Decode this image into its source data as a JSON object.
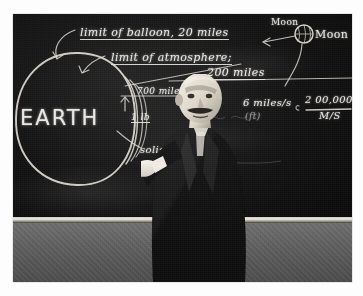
{
  "photograph": {
    "medium": "black-and-white photographic print",
    "scene": "man lecturing at a chalkboard"
  },
  "blackboard": {
    "annotations": [
      {
        "id": "balloon-limit",
        "text": "limit of balloon, 20 miles"
      },
      {
        "id": "atmosphere-limit",
        "text": "limit of atmosphere;"
      },
      {
        "id": "atmosphere-value",
        "text": "200 miles"
      },
      {
        "id": "moon-label",
        "text": "Moon"
      },
      {
        "id": "moon-caption",
        "text": "Moon"
      },
      {
        "id": "earth-label",
        "text": "EARTH"
      },
      {
        "id": "distance-700",
        "text": "700 miles"
      },
      {
        "id": "weight-1lb",
        "text": "1 lb"
      },
      {
        "id": "velocity",
        "text": "6 miles/s"
      },
      {
        "id": "velocity-unit",
        "text": "(ft)"
      },
      {
        "id": "fraction-num",
        "text": "2 00,000"
      },
      {
        "id": "fraction-den",
        "text": "M/S"
      },
      {
        "id": "solis",
        "text": "solis (H)"
      }
    ],
    "diagram": {
      "earth_circle": "large chalk circle at left labelled EARTH",
      "atmosphere_arcs": "three concentric arcs at the right edge of the earth circle",
      "moon_sketch": "small hatched circle at upper right",
      "pointer_arrows": "arrows from the text labels to the circle edges"
    },
    "colors": {
      "board": "#121212",
      "chalk": "#e8e6df",
      "rail": "#efeae2",
      "wall": "#5c5c5c",
      "print_border": "#fdfdfd"
    }
  },
  "subject": {
    "description": "bald man with moustache in a dark suit, chalk in right hand",
    "facing": "toward the board, head turned to camera"
  }
}
